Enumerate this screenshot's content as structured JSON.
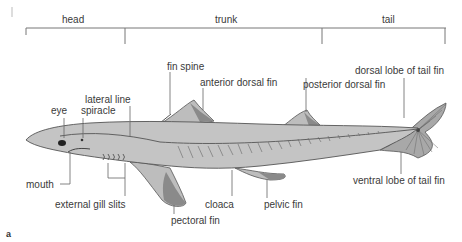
{
  "regions": {
    "head": "head",
    "trunk": "trunk",
    "tail": "tail"
  },
  "labels": {
    "fin_spine": "fin spine",
    "lateral_line": "lateral line",
    "anterior_dorsal_fin": "anterior dorsal fin",
    "posterior_dorsal_fin": "posterior dorsal fin",
    "dorsal_lobe_of_tail_fin": "dorsal lobe of tail fin",
    "eye": "eye",
    "spiracle": "spiracle",
    "mouth": "mouth",
    "external_gill_slits": "external gill slits",
    "pectoral_fin": "pectoral fin",
    "cloaca": "cloaca",
    "pelvic_fin": "pelvic fin",
    "ventral_lobe_of_tail_fin": "ventral lobe of tail fin"
  },
  "figure_letter": "a",
  "colors": {
    "body": "#c4c4c4",
    "outline": "#555555",
    "fin_dark": "#8a8a8a",
    "line": "#666666"
  }
}
